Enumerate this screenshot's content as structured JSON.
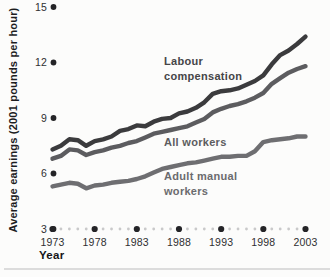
{
  "chart_data": {
    "type": "line",
    "title": "",
    "xlabel": "Year",
    "ylabel": "Average earnings (2001 pounds per hour)",
    "ylim": [
      3,
      15
    ],
    "yticks": [
      15,
      12,
      9,
      6,
      3
    ],
    "xticks": [
      1973,
      1978,
      1983,
      1988,
      1993,
      1998,
      2003
    ],
    "x": [
      1973,
      1974,
      1975,
      1976,
      1977,
      1978,
      1979,
      1980,
      1981,
      1982,
      1983,
      1984,
      1985,
      1986,
      1987,
      1988,
      1989,
      1990,
      1991,
      1992,
      1993,
      1994,
      1995,
      1996,
      1997,
      1998,
      1999,
      2000,
      2001,
      2002,
      2003
    ],
    "grid": false,
    "legend_position": "inline-annotations",
    "series": [
      {
        "name": "Labour compensation",
        "color": "#3b3b3d",
        "values": [
          7.3,
          7.5,
          7.85,
          7.8,
          7.5,
          7.75,
          7.85,
          8.0,
          8.3,
          8.4,
          8.6,
          8.55,
          8.8,
          8.95,
          9.0,
          9.25,
          9.35,
          9.55,
          9.85,
          10.3,
          10.45,
          10.5,
          10.6,
          10.8,
          11.0,
          11.3,
          11.9,
          12.4,
          12.65,
          13.0,
          13.4
        ]
      },
      {
        "name": "All workers",
        "color": "#5c5c5f",
        "values": [
          6.8,
          6.95,
          7.3,
          7.25,
          7.0,
          7.15,
          7.25,
          7.4,
          7.5,
          7.65,
          7.75,
          7.95,
          8.15,
          8.25,
          8.35,
          8.45,
          8.55,
          8.75,
          8.95,
          9.3,
          9.5,
          9.65,
          9.75,
          9.9,
          10.1,
          10.35,
          10.85,
          11.15,
          11.45,
          11.65,
          11.8
        ]
      },
      {
        "name": "Adult manual workers",
        "color": "#6e6e71",
        "values": [
          5.3,
          5.4,
          5.5,
          5.45,
          5.2,
          5.35,
          5.4,
          5.5,
          5.55,
          5.6,
          5.7,
          5.85,
          6.05,
          6.25,
          6.35,
          6.45,
          6.55,
          6.6,
          6.7,
          6.8,
          6.9,
          6.9,
          6.95,
          6.95,
          7.2,
          7.7,
          7.8,
          7.85,
          7.9,
          8.0,
          8.0
        ]
      }
    ],
    "style": {
      "background": "#fcfcfb",
      "line_width": 4.4,
      "big_dot_color": "#242427",
      "small_dot_color": "#c9c9ca",
      "tick_text_color": "#2f2f31",
      "divider_color": "#dcdcdc"
    }
  }
}
